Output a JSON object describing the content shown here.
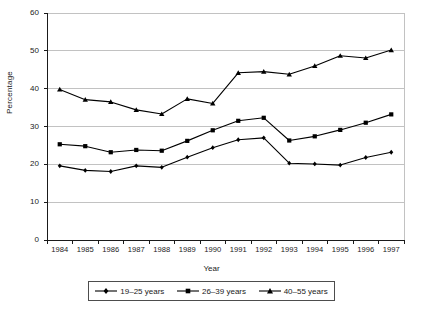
{
  "chart_data": {
    "type": "line",
    "title": "",
    "xlabel": "Year",
    "ylabel": "Percentage",
    "categories": [
      "1984",
      "1985",
      "1986",
      "1987",
      "1988",
      "1989",
      "1990",
      "1991",
      "1992",
      "1993",
      "1994",
      "1995",
      "1996",
      "1997"
    ],
    "x": [
      1984,
      1985,
      1986,
      1987,
      1988,
      1989,
      1990,
      1991,
      1992,
      1993,
      1994,
      1995,
      1996,
      1997
    ],
    "xlim": [
      1983.5,
      1997.5
    ],
    "ylim": [
      0,
      60
    ],
    "yticks": [
      0,
      10,
      20,
      30,
      40,
      50,
      60
    ],
    "grid": "horizontal",
    "legend_position": "bottom",
    "series": [
      {
        "name": "19–25 years",
        "marker": "diamond",
        "color": "#000000",
        "values": [
          19.6,
          18.4,
          18.1,
          19.6,
          19.2,
          21.9,
          24.4,
          26.5,
          27.0,
          20.3,
          20.1,
          19.8,
          21.8,
          23.2
        ]
      },
      {
        "name": "26–39 years",
        "marker": "square",
        "color": "#000000",
        "values": [
          25.3,
          24.8,
          23.2,
          23.8,
          23.6,
          26.2,
          29.0,
          31.5,
          32.3,
          26.3,
          27.4,
          29.1,
          31.0,
          33.2
        ]
      },
      {
        "name": "40–55 years",
        "marker": "triangle",
        "color": "#000000",
        "values": [
          39.8,
          37.1,
          36.5,
          34.4,
          33.3,
          37.3,
          36.1,
          44.2,
          44.5,
          43.8,
          46.0,
          48.7,
          48.1,
          50.2
        ]
      }
    ]
  },
  "axes": {
    "ylabel_text": "Percentage",
    "xlabel_text": "Year",
    "ytick_labels": [
      "60",
      "50",
      "40",
      "30",
      "20",
      "10",
      "0"
    ],
    "xtick_labels": [
      "1984",
      "1985",
      "1986",
      "1987",
      "1988",
      "1989",
      "1990",
      "1991",
      "1992",
      "1993",
      "1994",
      "1995",
      "1996",
      "1997"
    ]
  },
  "legend": {
    "items": [
      {
        "label": "19–25 years",
        "marker": "diamond-marker-icon"
      },
      {
        "label": "26–39 years",
        "marker": "square-marker-icon"
      },
      {
        "label": "40–55 years",
        "marker": "triangle-marker-icon"
      }
    ]
  },
  "colors": {
    "axis": "#1a1a1a",
    "grid": "#b3b3b3",
    "line": "#000000",
    "background": "#ffffff"
  }
}
